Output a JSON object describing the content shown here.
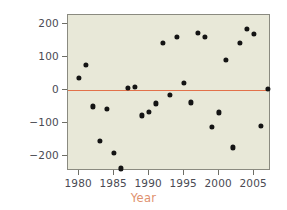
{
  "chart_data": {
    "type": "scatter",
    "title": "",
    "xlabel": "Year",
    "ylabel": "Residuals",
    "xlim": [
      1978.4,
      2007.4
    ],
    "ylim": [
      -245,
      226
    ],
    "grid": false,
    "legend": null,
    "xticks": [
      1980,
      1985,
      1990,
      1995,
      2000,
      2005
    ],
    "yticks": [
      200,
      100,
      0,
      -100,
      -200
    ],
    "ytick_labels": [
      "200",
      "100",
      "0",
      "−100",
      "−200"
    ],
    "xtick_labels": [
      "1980",
      "1985",
      "1990",
      "1995",
      "2000",
      "2005"
    ],
    "reference_lines": [
      {
        "name": "zero-residual-line",
        "y": 0,
        "color": "#e2714a"
      }
    ],
    "x": [
      1980,
      1981,
      1982,
      1983,
      1984,
      1985,
      1986,
      1987,
      1988,
      1989,
      1990,
      1991,
      1992,
      1993,
      1994,
      1995,
      1996,
      1997,
      1998,
      1999,
      2000,
      2001,
      2002,
      2003,
      2004,
      2005,
      2006,
      2007
    ],
    "y": [
      37,
      75,
      -50,
      -155,
      -57,
      -190,
      -237,
      6,
      10,
      -77,
      -66,
      -41,
      141,
      -15,
      160,
      21,
      -38,
      172,
      161,
      -113,
      -68,
      91,
      -174,
      141,
      184,
      170,
      -108,
      4
    ],
    "marker": "filled-circle",
    "marker_color": "#141414",
    "plot_background": "#e8e8d8",
    "axis_label_color": "#e0916e",
    "tick_label_color": "#4a4a52"
  }
}
